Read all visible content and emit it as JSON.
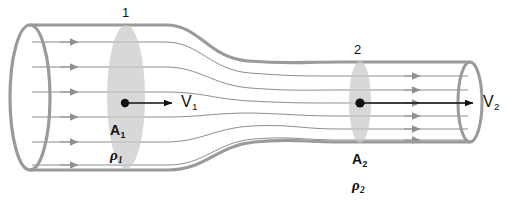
{
  "figure": {
    "type": "stream-tube-diagram",
    "background_color": "#ffffff",
    "wall_color": "#9a9a9a",
    "streamline_color": "#8a8a8a",
    "section_fill_color": "#c8c8c8",
    "vector_color": "#111111"
  },
  "stations": {
    "inlet": {
      "number": "1",
      "velocity_symbol": "V",
      "velocity_subscript": "1",
      "area_symbol": "A",
      "area_subscript": "1",
      "density_symbol": "ρ",
      "density_subscript": "1"
    },
    "outlet": {
      "number": "2",
      "velocity_symbol": "V",
      "velocity_subscript": "2",
      "area_symbol": "A",
      "area_subscript": "2",
      "density_symbol": "ρ",
      "density_subscript": "2"
    }
  },
  "geometry": {
    "inlet_streamline_count": 6,
    "outlet_streamline_count": 6,
    "tube_left_x": 30,
    "tube_right_x": 472,
    "inlet_top_y": 25,
    "inlet_bottom_y": 170,
    "outlet_top_y": 62,
    "outlet_bottom_y": 142
  }
}
